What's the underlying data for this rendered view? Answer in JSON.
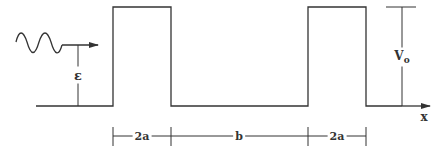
{
  "diagram": {
    "title": "",
    "type": "periodic square potential barrier (Kronig-Penney)",
    "colors": {
      "line": "#333333",
      "background": "#ffffff"
    },
    "labels": {
      "energy": "ε",
      "barrier_height": "V",
      "barrier_height_sub": "o",
      "x_axis": "x",
      "barrier_width_1": "2a",
      "well_width": "b",
      "barrier_width_2": "2a"
    },
    "elements": {
      "incident_wave": "sinusoidal wave with arrow pointing right",
      "barriers": 2,
      "dimension_segments": [
        "2a",
        "b",
        "2a"
      ]
    }
  }
}
